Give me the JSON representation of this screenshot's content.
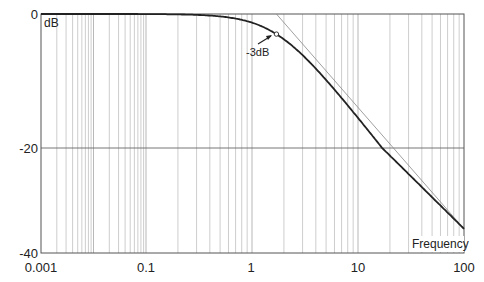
{
  "chart_data": {
    "type": "line",
    "title": "",
    "xlabel": "Frequency",
    "ylabel": "dB",
    "x_scale": "log",
    "x_ticks": [
      {
        "label": "0.001",
        "px": 41
      },
      {
        "label": "0.1",
        "px": 146
      },
      {
        "label": "1",
        "px": 251
      },
      {
        "label": "10",
        "px": 358
      },
      {
        "label": "100",
        "px": 464
      }
    ],
    "y_ticks": [
      {
        "label": "0",
        "value": 0,
        "py": 14
      },
      {
        "label": "-20",
        "value": -20,
        "py": 148
      },
      {
        "label": "-40",
        "value": -40,
        "py": 253
      }
    ],
    "ylim": [
      -40,
      0
    ],
    "xlim": [
      0.001,
      100
    ],
    "grid": true,
    "corner_frequency": 1.7,
    "series": [
      {
        "name": "Magnitude response (1st-order low-pass)",
        "x": [
          0.001,
          0.01,
          0.1,
          0.3,
          0.5,
          1,
          1.7,
          3,
          5,
          10,
          20,
          50,
          100
        ],
        "values": [
          0,
          0,
          -0.01,
          -0.13,
          -0.36,
          -1.2,
          -3.0,
          -6.3,
          -10.3,
          -15.5,
          -21.5,
          -29.4,
          -35.4
        ]
      },
      {
        "name": "Asymptote",
        "x": [
          1.7,
          100
        ],
        "values": [
          0,
          -35.4
        ]
      }
    ],
    "annotations": [
      {
        "text": "-3dB",
        "x": 1.7,
        "y": -3
      }
    ]
  },
  "labels": {
    "y_unit": "dB",
    "x_axis": "Frequency",
    "marker": "-3dB"
  }
}
